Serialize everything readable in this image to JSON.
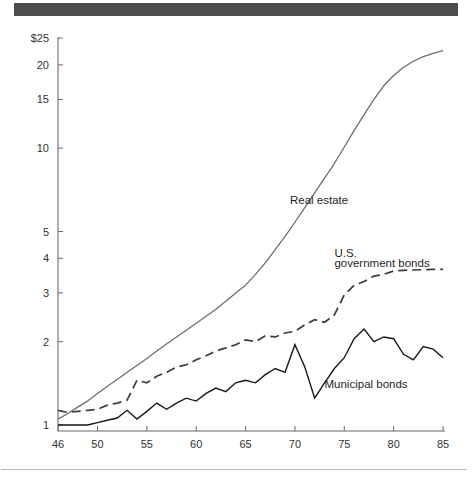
{
  "figure": {
    "top_bar_color": "#4d4d4d",
    "background_color": "#ffffff"
  },
  "chart_data": {
    "type": "line",
    "title": "",
    "subtitle": "",
    "xlabel": "",
    "ylabel": "",
    "yscale": "log",
    "ylim": [
      0.92,
      25
    ],
    "xlim": [
      46,
      85
    ],
    "grid": false,
    "legend": "inline-labels",
    "y_tick_labels": [
      "1",
      "2",
      "3",
      "4",
      "5",
      "10",
      "15",
      "20",
      "$25"
    ],
    "y_tick_values": [
      1,
      2,
      3,
      4,
      5,
      10,
      15,
      20,
      25
    ],
    "x_tick_labels": [
      "46",
      "50",
      "55",
      "60",
      "65",
      "70",
      "75",
      "80",
      "85"
    ],
    "x_tick_values": [
      46,
      50,
      55,
      60,
      65,
      70,
      75,
      80,
      85
    ],
    "series": [
      {
        "name": "Real estate",
        "style": "solid-gray",
        "label_text": "Real estate",
        "x": [
          46,
          47,
          48,
          49,
          50,
          51,
          52,
          53,
          54,
          55,
          56,
          57,
          58,
          59,
          60,
          61,
          62,
          63,
          64,
          65,
          66,
          67,
          68,
          69,
          70,
          71,
          72,
          73,
          74,
          75,
          76,
          77,
          78,
          79,
          80,
          81,
          82,
          83,
          84,
          85
        ],
        "values": [
          1.05,
          1.1,
          1.16,
          1.22,
          1.3,
          1.38,
          1.46,
          1.55,
          1.64,
          1.74,
          1.85,
          1.96,
          2.08,
          2.2,
          2.33,
          2.47,
          2.62,
          2.8,
          3.0,
          3.2,
          3.5,
          3.85,
          4.3,
          4.8,
          5.4,
          6.1,
          6.9,
          7.8,
          8.8,
          10.1,
          11.6,
          13.2,
          15.0,
          16.8,
          18.3,
          19.6,
          20.6,
          21.4,
          22.0,
          22.5
        ]
      },
      {
        "name": "U.S. government bonds",
        "style": "dashed",
        "label_text": "U.S.\ngovernment bonds",
        "label_line1": "U.S.",
        "label_line2": "government bonds",
        "x": [
          46,
          47,
          48,
          49,
          50,
          51,
          52,
          53,
          54,
          55,
          56,
          57,
          58,
          59,
          60,
          61,
          62,
          63,
          64,
          65,
          66,
          67,
          68,
          69,
          70,
          71,
          72,
          73,
          74,
          75,
          76,
          77,
          78,
          79,
          80,
          81,
          82,
          83,
          84,
          85
        ],
        "values": [
          1.13,
          1.11,
          1.12,
          1.13,
          1.14,
          1.18,
          1.2,
          1.23,
          1.45,
          1.42,
          1.5,
          1.55,
          1.62,
          1.65,
          1.72,
          1.78,
          1.85,
          1.9,
          1.95,
          2.03,
          2.0,
          2.1,
          2.08,
          2.15,
          2.18,
          2.3,
          2.4,
          2.35,
          2.5,
          2.95,
          3.2,
          3.3,
          3.45,
          3.5,
          3.6,
          3.62,
          3.63,
          3.64,
          3.65,
          3.65
        ]
      },
      {
        "name": "Municipal bonds",
        "style": "solid-dark",
        "label_text": "Municipal bonds",
        "x": [
          46,
          47,
          48,
          49,
          50,
          51,
          52,
          53,
          54,
          55,
          56,
          57,
          58,
          59,
          60,
          61,
          62,
          63,
          64,
          65,
          66,
          67,
          68,
          69,
          70,
          71,
          72,
          73,
          74,
          75,
          76,
          77,
          78,
          79,
          80,
          81,
          82,
          83,
          84,
          85
        ],
        "values": [
          1.0,
          1.0,
          1.0,
          1.0,
          1.02,
          1.04,
          1.06,
          1.13,
          1.05,
          1.12,
          1.2,
          1.14,
          1.2,
          1.25,
          1.22,
          1.3,
          1.36,
          1.32,
          1.42,
          1.45,
          1.42,
          1.52,
          1.6,
          1.55,
          1.95,
          1.62,
          1.25,
          1.42,
          1.6,
          1.75,
          2.05,
          2.22,
          2.0,
          2.08,
          2.05,
          1.8,
          1.72,
          1.92,
          1.88,
          1.75
        ]
      }
    ],
    "annotations": [
      {
        "text": "Real estate",
        "x": 69.5,
        "y": 6.3
      },
      {
        "text": "U.S.",
        "x": 74.0,
        "y": 4.05
      },
      {
        "text": "government bonds",
        "x": 74.0,
        "y": 3.72
      },
      {
        "text": "Municipal bonds",
        "x": 73.0,
        "y": 1.36
      }
    ]
  }
}
